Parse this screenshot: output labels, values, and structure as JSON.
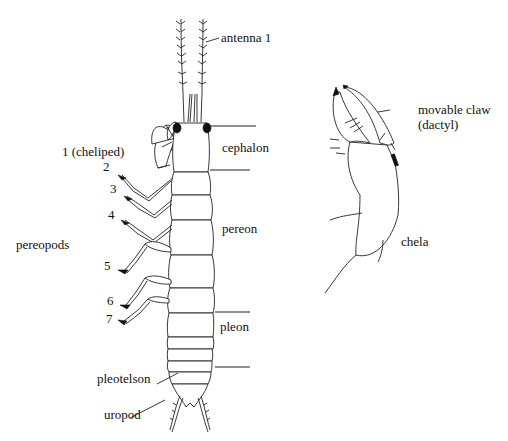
{
  "figure": {
    "labels": {
      "antenna": "antenna 1",
      "cheliped": "1 (cheliped)",
      "cephalon": "cephalon",
      "pereon": "pereon",
      "pleon": "pleon",
      "pereopods": "pereopods",
      "pleotelson": "pleotelson",
      "uropod": "uropod",
      "movable_claw": "movable claw",
      "dactyl": "(dactyl)",
      "chela": "chela"
    },
    "leg_numbers": [
      "2",
      "3",
      "4",
      "5",
      "6",
      "7"
    ],
    "colors": {
      "ink": "#222222",
      "background": "#ffffff"
    }
  }
}
